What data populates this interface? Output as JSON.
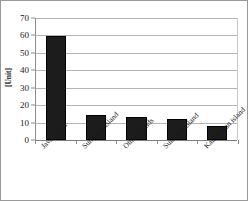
{
  "chart_data": {
    "type": "bar",
    "title": "",
    "xlabel": "",
    "ylabel": "[Unit]",
    "categories": [
      "Java island",
      "Sumatera island",
      "Other islands",
      "Sulawesi island",
      "Kalimantan island"
    ],
    "values": [
      59.5,
      14.5,
      13.3,
      12.0,
      8.0
    ],
    "ylim": [
      0,
      70
    ],
    "ytick_values": [
      0,
      10,
      20,
      30,
      40,
      50,
      60,
      70
    ],
    "ytick_labels": [
      "0",
      "10",
      "20",
      "30",
      "40",
      "50",
      "60",
      "70"
    ],
    "grid": true,
    "legend": false,
    "bar_color": "#1c1c1c",
    "gridline_color": "#b4b4b4",
    "axis_color": "#8c8c8c",
    "background_color": "#ffffff",
    "xtick_label_rotation": -45
  }
}
